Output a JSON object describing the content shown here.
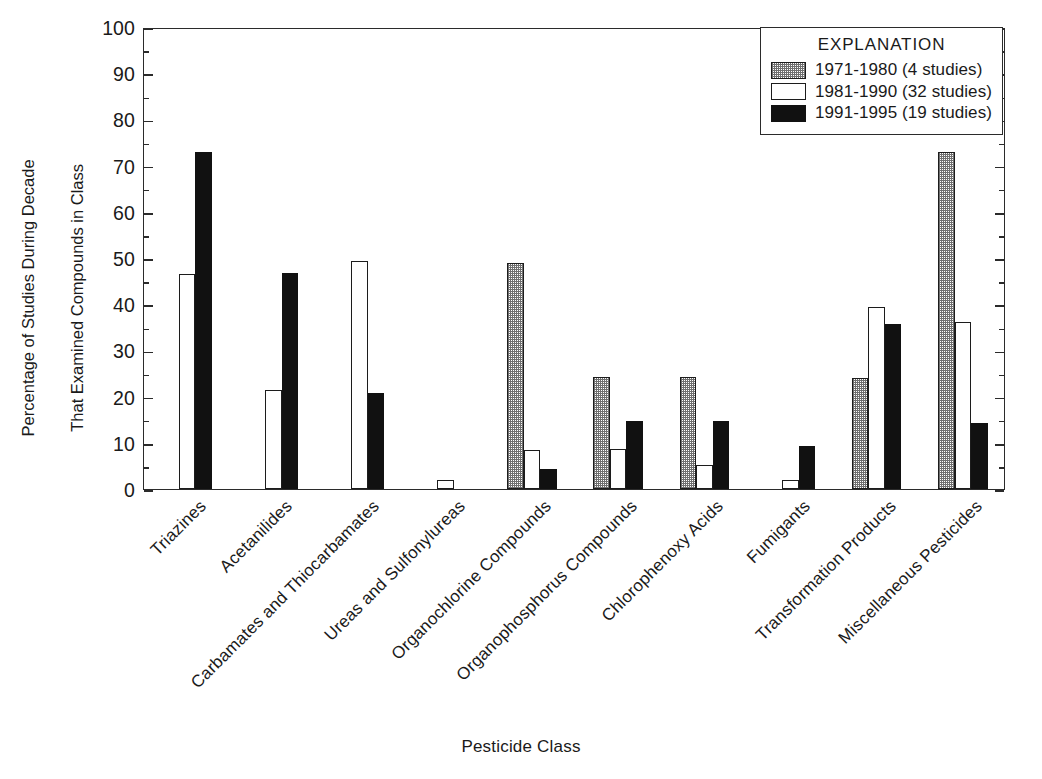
{
  "chart_data": {
    "type": "bar",
    "title": "",
    "xlabel": "Pesticide Class",
    "ylabel": "Percentage of Studies During Decade That Examined Compounds in Class",
    "ylabel_line1": "Percentage of Studies During Decade",
    "ylabel_line2": "That Examined Compounds in Class",
    "ylim": [
      0,
      100
    ],
    "ytick_step": 10,
    "yminor_step": 5,
    "grid": false,
    "legend_position": "top-right",
    "legend_title": "EXPLANATION",
    "ytick_labels": [
      "100",
      "90",
      "80",
      "70",
      "60",
      "50",
      "40",
      "30",
      "20",
      "10",
      "0"
    ],
    "categories": [
      "Triazines",
      "Acetanilides",
      "Carbamates and Thiocarbamates",
      "Ureas and Sulfonylureas",
      "Organochlorine Compounds",
      "Organophosphorus Compounds",
      "Chlorophenoxy Acids",
      "Fumigants",
      "Transformation Products",
      "Miscellaneous Pesticides"
    ],
    "series": [
      {
        "name": "1971-1980 (4 studies)",
        "fill": "stipple-gray",
        "values": [
          0,
          0,
          0,
          0,
          49.0,
          24.3,
          24.3,
          0,
          24.0,
          73.0
        ]
      },
      {
        "name": "1981-1990 (32 studies)",
        "fill": "white",
        "values": [
          46.5,
          21.5,
          49.3,
          2.0,
          8.5,
          8.6,
          5.2,
          2.0,
          39.4,
          36.2
        ]
      },
      {
        "name": "1991-1995 (19 studies)",
        "fill": "black",
        "values": [
          73.0,
          46.7,
          20.7,
          0,
          4.3,
          14.8,
          14.8,
          9.3,
          35.7,
          14.3
        ]
      }
    ],
    "colors": {
      "series_1971_1980": "#6f6f6f",
      "series_1981_1990": "#ffffff",
      "series_1991_1995": "#111111",
      "axis": "#2b2b2b",
      "background": "#ffffff"
    }
  }
}
